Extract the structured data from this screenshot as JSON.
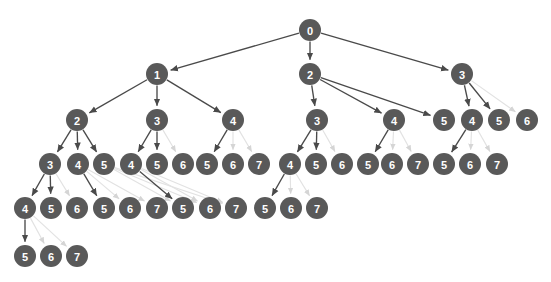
{
  "diagram": {
    "type": "tree",
    "canvas": {
      "width": 551,
      "height": 282,
      "background": "#ffffff"
    },
    "style": {
      "node_fill": "#595959",
      "node_text_color": "#ffffff",
      "node_radius": 11,
      "edge_color_strong": "#4a4a4a",
      "edge_color_faded": "#e2e2e2",
      "edge_color_mid": "#d8d8d8"
    },
    "levels": [
      {
        "index": 0,
        "y": 30
      },
      {
        "index": 1,
        "y": 74
      },
      {
        "index": 2,
        "y": 120
      },
      {
        "index": 3,
        "y": 164
      },
      {
        "index": 4,
        "y": 208
      },
      {
        "index": 5,
        "y": 256
      }
    ],
    "nodes": [
      {
        "id": "n0",
        "label": "0",
        "x": 310,
        "y": 30,
        "level": 0
      },
      {
        "id": "n1",
        "label": "1",
        "x": 157,
        "y": 74,
        "level": 1
      },
      {
        "id": "n2",
        "label": "2",
        "x": 310,
        "y": 74,
        "level": 1
      },
      {
        "id": "n3",
        "label": "3",
        "x": 462,
        "y": 74,
        "level": 1
      },
      {
        "id": "n4",
        "label": "2",
        "x": 77,
        "y": 120,
        "level": 2
      },
      {
        "id": "n5",
        "label": "3",
        "x": 157,
        "y": 120,
        "level": 2
      },
      {
        "id": "n6",
        "label": "4",
        "x": 233,
        "y": 120,
        "level": 2
      },
      {
        "id": "n7",
        "label": "3",
        "x": 317,
        "y": 120,
        "level": 2
      },
      {
        "id": "n8",
        "label": "4",
        "x": 394,
        "y": 120,
        "level": 2
      },
      {
        "id": "n9",
        "label": "5",
        "x": 444,
        "y": 120,
        "level": 2
      },
      {
        "id": "n10",
        "label": "4",
        "x": 472,
        "y": 120,
        "level": 2
      },
      {
        "id": "n11",
        "label": "5",
        "x": 499,
        "y": 120,
        "level": 2
      },
      {
        "id": "n12",
        "label": "6",
        "x": 527,
        "y": 120,
        "level": 2
      },
      {
        "id": "n13",
        "label": "3",
        "x": 50,
        "y": 164,
        "level": 3
      },
      {
        "id": "n14",
        "label": "4",
        "x": 78,
        "y": 164,
        "level": 3
      },
      {
        "id": "n15",
        "label": "5",
        "x": 104,
        "y": 164,
        "level": 3
      },
      {
        "id": "n16",
        "label": "4",
        "x": 131,
        "y": 164,
        "level": 3
      },
      {
        "id": "n17",
        "label": "5",
        "x": 157,
        "y": 164,
        "level": 3
      },
      {
        "id": "n18",
        "label": "6",
        "x": 183,
        "y": 164,
        "level": 3
      },
      {
        "id": "n19",
        "label": "5",
        "x": 207,
        "y": 164,
        "level": 3
      },
      {
        "id": "n20",
        "label": "6",
        "x": 233,
        "y": 164,
        "level": 3
      },
      {
        "id": "n21",
        "label": "7",
        "x": 259,
        "y": 164,
        "level": 3
      },
      {
        "id": "n22",
        "label": "4",
        "x": 290,
        "y": 164,
        "level": 3
      },
      {
        "id": "n23",
        "label": "5",
        "x": 316,
        "y": 164,
        "level": 3
      },
      {
        "id": "n24",
        "label": "6",
        "x": 342,
        "y": 164,
        "level": 3
      },
      {
        "id": "n25",
        "label": "5",
        "x": 368,
        "y": 164,
        "level": 3
      },
      {
        "id": "n26",
        "label": "6",
        "x": 392,
        "y": 164,
        "level": 3
      },
      {
        "id": "n27",
        "label": "7",
        "x": 418,
        "y": 164,
        "level": 3
      },
      {
        "id": "n28",
        "label": "5",
        "x": 444,
        "y": 164,
        "level": 3
      },
      {
        "id": "n29",
        "label": "6",
        "x": 470,
        "y": 164,
        "level": 3
      },
      {
        "id": "n30",
        "label": "7",
        "x": 497,
        "y": 164,
        "level": 3
      },
      {
        "id": "n31",
        "label": "4",
        "x": 25,
        "y": 208,
        "level": 4
      },
      {
        "id": "n32",
        "label": "5",
        "x": 51,
        "y": 208,
        "level": 4
      },
      {
        "id": "n33",
        "label": "6",
        "x": 77,
        "y": 208,
        "level": 4
      },
      {
        "id": "n34",
        "label": "5",
        "x": 104,
        "y": 208,
        "level": 4
      },
      {
        "id": "n35",
        "label": "6",
        "x": 130,
        "y": 208,
        "level": 4
      },
      {
        "id": "n36",
        "label": "7",
        "x": 157,
        "y": 208,
        "level": 4
      },
      {
        "id": "n37",
        "label": "5",
        "x": 183,
        "y": 208,
        "level": 4
      },
      {
        "id": "n38",
        "label": "6",
        "x": 210,
        "y": 208,
        "level": 4
      },
      {
        "id": "n39",
        "label": "7",
        "x": 236,
        "y": 208,
        "level": 4
      },
      {
        "id": "n40",
        "label": "5",
        "x": 265,
        "y": 208,
        "level": 4
      },
      {
        "id": "n41",
        "label": "6",
        "x": 291,
        "y": 208,
        "level": 4
      },
      {
        "id": "n42",
        "label": "7",
        "x": 317,
        "y": 208,
        "level": 4
      },
      {
        "id": "n43",
        "label": "5",
        "x": 25,
        "y": 256,
        "level": 5
      },
      {
        "id": "n44",
        "label": "6",
        "x": 51,
        "y": 256,
        "level": 5
      },
      {
        "id": "n45",
        "label": "7",
        "x": 77,
        "y": 256,
        "level": 5
      }
    ],
    "edges": [
      {
        "from": "n0",
        "to": "n1",
        "weight": "strong"
      },
      {
        "from": "n0",
        "to": "n2",
        "weight": "strong"
      },
      {
        "from": "n0",
        "to": "n3",
        "weight": "strong"
      },
      {
        "from": "n1",
        "to": "n4",
        "weight": "strong"
      },
      {
        "from": "n1",
        "to": "n5",
        "weight": "strong"
      },
      {
        "from": "n1",
        "to": "n6",
        "weight": "strong"
      },
      {
        "from": "n2",
        "to": "n7",
        "weight": "strong"
      },
      {
        "from": "n2",
        "to": "n8",
        "weight": "strong"
      },
      {
        "from": "n2",
        "to": "n9",
        "weight": "strong"
      },
      {
        "from": "n3",
        "to": "n10",
        "weight": "strong"
      },
      {
        "from": "n3",
        "to": "n11",
        "weight": "strong"
      },
      {
        "from": "n3",
        "to": "n12",
        "weight": "faded"
      },
      {
        "from": "n4",
        "to": "n13",
        "weight": "strong"
      },
      {
        "from": "n4",
        "to": "n14",
        "weight": "strong"
      },
      {
        "from": "n4",
        "to": "n15",
        "weight": "strong"
      },
      {
        "from": "n5",
        "to": "n16",
        "weight": "strong"
      },
      {
        "from": "n5",
        "to": "n17",
        "weight": "strong"
      },
      {
        "from": "n5",
        "to": "n18",
        "weight": "faded"
      },
      {
        "from": "n6",
        "to": "n19",
        "weight": "strong"
      },
      {
        "from": "n6",
        "to": "n20",
        "weight": "faded"
      },
      {
        "from": "n6",
        "to": "n21",
        "weight": "faded"
      },
      {
        "from": "n7",
        "to": "n22",
        "weight": "strong"
      },
      {
        "from": "n7",
        "to": "n23",
        "weight": "strong"
      },
      {
        "from": "n7",
        "to": "n24",
        "weight": "faded"
      },
      {
        "from": "n8",
        "to": "n25",
        "weight": "strong"
      },
      {
        "from": "n8",
        "to": "n26",
        "weight": "faded"
      },
      {
        "from": "n8",
        "to": "n27",
        "weight": "faded"
      },
      {
        "from": "n10",
        "to": "n28",
        "weight": "strong"
      },
      {
        "from": "n10",
        "to": "n29",
        "weight": "faded"
      },
      {
        "from": "n10",
        "to": "n30",
        "weight": "faded"
      },
      {
        "from": "n13",
        "to": "n31",
        "weight": "strong"
      },
      {
        "from": "n13",
        "to": "n32",
        "weight": "strong"
      },
      {
        "from": "n13",
        "to": "n33",
        "weight": "faded"
      },
      {
        "from": "n14",
        "to": "n34",
        "weight": "strong"
      },
      {
        "from": "n14",
        "to": "n35",
        "weight": "faded"
      },
      {
        "from": "n14",
        "to": "n36",
        "weight": "faded"
      },
      {
        "from": "n15",
        "to": "n37",
        "weight": "faded"
      },
      {
        "from": "n15",
        "to": "n38",
        "weight": "faded"
      },
      {
        "from": "n15",
        "to": "n39",
        "weight": "faded"
      },
      {
        "from": "n16",
        "to": "n37",
        "weight": "strong"
      },
      {
        "from": "n16",
        "to": "n38",
        "weight": "faded"
      },
      {
        "from": "n16",
        "to": "n39",
        "weight": "faded"
      },
      {
        "from": "n22",
        "to": "n40",
        "weight": "strong"
      },
      {
        "from": "n22",
        "to": "n41",
        "weight": "faded"
      },
      {
        "from": "n22",
        "to": "n42",
        "weight": "faded"
      },
      {
        "from": "n31",
        "to": "n43",
        "weight": "strong"
      },
      {
        "from": "n31",
        "to": "n44",
        "weight": "faded"
      },
      {
        "from": "n31",
        "to": "n45",
        "weight": "faded"
      }
    ]
  }
}
